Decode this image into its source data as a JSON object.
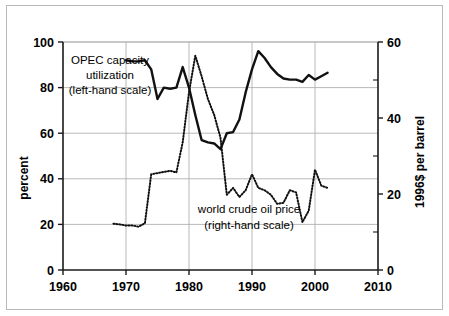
{
  "chart_data": {
    "type": "line",
    "title": "",
    "xlabel": "",
    "ylabel": "percent",
    "y2label": "1996$ per barrel",
    "xlim": [
      1960,
      2010
    ],
    "ylim": [
      0,
      100
    ],
    "y2lim": [
      0,
      60
    ],
    "grid": true,
    "legend_position": "inline-annotations",
    "x_ticks": [
      1960,
      1970,
      1980,
      1990,
      2000,
      2010
    ],
    "x_tick_labels": [
      "1960",
      "1970",
      "1980",
      "1990",
      "2000",
      "2010"
    ],
    "y_ticks": [
      0,
      20,
      40,
      60,
      80,
      100
    ],
    "y_tick_labels": [
      "0",
      "20",
      "40",
      "60",
      "80",
      "100"
    ],
    "y2_ticks": [
      0,
      20,
      40,
      60
    ],
    "y2_tick_labels": [
      "0",
      "20",
      "40",
      "60"
    ],
    "y2_minor_ticks": [
      10,
      30,
      50
    ],
    "series": [
      {
        "name": "OPEC capacity utilization",
        "axis": "left",
        "style": "solid",
        "annotation": "OPEC capacity\nutilization\n(left-hand scale)",
        "x": [
          1970,
          1971,
          1972,
          1973,
          1974,
          1975,
          1976,
          1977,
          1978,
          1979,
          1980,
          1981,
          1982,
          1983,
          1984,
          1985,
          1986,
          1987,
          1988,
          1989,
          1990,
          1991,
          1992,
          1993,
          1994,
          1995,
          1996,
          1997,
          1998,
          1999,
          2000,
          2001,
          2002
        ],
        "values": [
          92,
          91.5,
          91.5,
          92,
          88,
          75,
          80,
          79.5,
          80,
          89,
          80,
          68,
          57,
          56,
          55.5,
          53,
          60,
          60.5,
          66,
          78,
          88,
          96,
          93,
          89,
          86,
          84,
          83.5,
          83.5,
          82.5,
          85.5,
          83.5,
          85,
          86.5
        ]
      },
      {
        "name": "world crude oil price",
        "axis": "right",
        "style": "dotted",
        "annotation": "world crude oil price\n(right-hand scale)",
        "x": [
          1968,
          1969,
          1970,
          1971,
          1972,
          1973,
          1974,
          1975,
          1976,
          1977,
          1978,
          1979,
          1980,
          1981,
          1982,
          1983,
          1984,
          1985,
          1986,
          1987,
          1988,
          1989,
          1990,
          1991,
          1992,
          1993,
          1994,
          1995,
          1996,
          1997,
          1998,
          1999,
          2000,
          2001,
          2002
        ],
        "values_percent_scale": [
          20.3,
          20,
          19.5,
          19.5,
          19,
          20.5,
          42,
          42.5,
          43,
          43.5,
          42.8,
          56,
          78,
          94,
          85,
          75,
          68,
          58,
          33,
          36,
          32,
          35,
          42,
          36,
          35,
          33,
          29,
          29.5,
          35,
          34,
          21,
          26,
          44,
          37,
          36
        ],
        "values": [
          12.2,
          12.0,
          11.7,
          11.7,
          11.4,
          12.3,
          25.2,
          25.5,
          25.8,
          26.1,
          25.7,
          33.6,
          46.8,
          56.4,
          51.0,
          45.0,
          40.8,
          34.8,
          19.8,
          21.6,
          19.2,
          21.0,
          25.2,
          21.6,
          21.0,
          19.8,
          17.4,
          17.7,
          21.0,
          20.4,
          12.6,
          15.6,
          26.4,
          22.2,
          21.6
        ]
      }
    ]
  },
  "annotations": {
    "series1_line1": "OPEC capacity",
    "series1_line2": "utilization",
    "series1_line3": "(left-hand scale)",
    "series2_line1": "world crude oil price",
    "series2_line2": "(right-hand scale)"
  },
  "axes": {
    "left_title": "percent",
    "right_title": "1996$ per barrel"
  },
  "colors": {
    "line": "#111111",
    "grid": "#b0b0b0",
    "axis": "#1a1a1a",
    "frame": "#b9b9b9",
    "background": "#ffffff"
  }
}
